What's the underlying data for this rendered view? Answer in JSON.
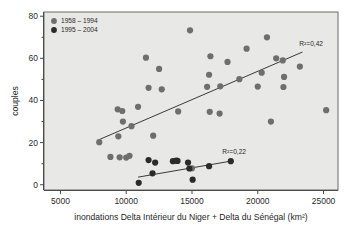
{
  "chart_data": {
    "type": "scatter",
    "title": "",
    "xlabel": "inondations Delta Intérieur du Niger + Delta du Sénégal (km²)",
    "ylabel": "couples",
    "xlim": [
      3750,
      26100
    ],
    "ylim": [
      -2.5,
      82
    ],
    "xticks": [
      5000,
      10000,
      15000,
      20000,
      25000
    ],
    "xticklabels": [
      "5000",
      "10000",
      "15000",
      "20000",
      "25000"
    ],
    "yticks": [
      0,
      20,
      40,
      60,
      80
    ],
    "yticklabels": [
      "0",
      "20",
      "40",
      "60",
      "80"
    ],
    "grid": false,
    "legend_position": "top-left",
    "plot_background": "#e8e8e6",
    "series": [
      {
        "name": "1958 – 1994",
        "color": "#6e6e6e",
        "marker": "circle",
        "points": [
          [
            7950,
            20.2
          ],
          [
            8800,
            13.2
          ],
          [
            9350,
            35.8
          ],
          [
            9400,
            23.0
          ],
          [
            9500,
            13.0
          ],
          [
            9700,
            35.0
          ],
          [
            9750,
            30.0
          ],
          [
            10000,
            12.9
          ],
          [
            10250,
            13.7
          ],
          [
            10400,
            27.8
          ],
          [
            10900,
            37.0
          ],
          [
            11500,
            60.3
          ],
          [
            11700,
            46.0
          ],
          [
            12050,
            23.3
          ],
          [
            12500,
            55.0
          ],
          [
            12700,
            45.3
          ],
          [
            13950,
            34.8
          ],
          [
            14850,
            73.3
          ],
          [
            15000,
            7.8
          ],
          [
            16150,
            46.5
          ],
          [
            16300,
            52.2
          ],
          [
            16350,
            34.6
          ],
          [
            16400,
            61.0
          ],
          [
            17100,
            33.8
          ],
          [
            17150,
            46.7
          ],
          [
            17700,
            58.3
          ],
          [
            18600,
            50.1
          ],
          [
            19150,
            64.6
          ],
          [
            20000,
            46.6
          ],
          [
            20300,
            53.2
          ],
          [
            20700,
            70.0
          ],
          [
            21000,
            30.0
          ],
          [
            21400,
            60.0
          ],
          [
            21900,
            59.0
          ],
          [
            21950,
            46.4
          ],
          [
            22000,
            51.2
          ],
          [
            23200,
            56.1
          ],
          [
            25200,
            35.4
          ]
        ],
        "fit_line": {
          "x0": 7900,
          "y0": 21.3,
          "x1": 23400,
          "y1": 63.0
        },
        "r2_label": "R²=0,42",
        "r2_value": 0.42
      },
      {
        "name": "1995 – 2004",
        "color": "#2b2b2b",
        "marker": "circle",
        "points": [
          [
            10950,
            0.9
          ],
          [
            11700,
            11.7
          ],
          [
            12000,
            5.4
          ],
          [
            12200,
            10.5
          ],
          [
            13550,
            11.2
          ],
          [
            13800,
            11.4
          ],
          [
            13900,
            11.3
          ],
          [
            14700,
            10.5
          ],
          [
            14800,
            7.7
          ],
          [
            15050,
            2.4
          ],
          [
            16300,
            8.8
          ],
          [
            17950,
            11.2
          ]
        ],
        "fit_line": {
          "x0": 10900,
          "y0": 3.6,
          "x1": 17950,
          "y1": 11.2
        },
        "r2_label": "R²=0,22",
        "r2_value": 0.22
      }
    ]
  },
  "legend": {
    "items": [
      {
        "label": "1958 – 1994",
        "color": "#6e6e6e"
      },
      {
        "label": "1995 – 2004",
        "color": "#2b2b2b"
      }
    ]
  }
}
